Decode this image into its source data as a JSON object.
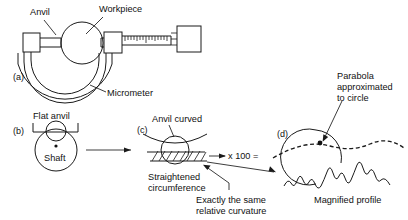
{
  "figure": {
    "title_present": false,
    "panels": [
      {
        "id": "a",
        "tag": "(a)",
        "labels": {
          "anvil": "Anvil",
          "workpiece": "Workpiece",
          "micrometer": "Micrometer"
        }
      },
      {
        "id": "b",
        "tag": "(b)",
        "labels": {
          "flat_anvil": "Flat anvil",
          "shaft": "Shaft"
        }
      },
      {
        "id": "c",
        "tag": "(c)",
        "labels": {
          "anvil_curved": "Anvil curved",
          "straightened_line1": "Straightened",
          "straightened_line2": "circumference"
        }
      },
      {
        "id": "d",
        "tag": "(d)",
        "labels": {
          "parabola_line1": "Parabola",
          "parabola_line2": "approximated",
          "parabola_line3": "to circle",
          "magnified_profile": "Magnified profile"
        }
      }
    ],
    "annotations": {
      "multiplier": "x 100 =",
      "same_curvature_line1": "Exactly the same",
      "same_curvature_line2": "relative curvature"
    },
    "colors": {
      "ink": "#1a1a1a",
      "text": "#111111",
      "background": "#ffffff"
    }
  }
}
